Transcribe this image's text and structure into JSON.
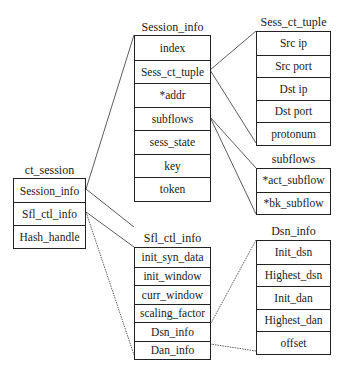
{
  "structs": {
    "ct_session": {
      "title": "ct_session",
      "fields": [
        "Session_info",
        "Sfl_ctl_info",
        "Hash_handle"
      ]
    },
    "session_info": {
      "title": "Session_info",
      "fields": [
        "index",
        "Sess_ct_tuple",
        "*addr",
        "subflows",
        "sess_state",
        "key",
        "token"
      ]
    },
    "sfl_ctl_info": {
      "title": "Sfl_ctl_info",
      "fields": [
        "init_syn_data",
        "init_window",
        "curr_window",
        "scaling_factor",
        "Dsn_info",
        "Dan_info"
      ]
    },
    "sess_ct_tuple": {
      "title": "Sess_ct_tuple",
      "fields": [
        "Src ip",
        "Src port",
        "Dst ip",
        "Dst port",
        "protonum"
      ]
    },
    "subflows": {
      "title": "subflows",
      "fields": [
        "*act_subflow",
        "*bk_subflow"
      ]
    },
    "dsn_info": {
      "title": "Dsn_info",
      "fields": [
        "Init_dsn",
        "Highest_dsn",
        "Init_dan",
        "Highest_dan",
        "offset"
      ]
    }
  },
  "links": [
    {
      "from": "ct_session.Session_info",
      "to": "Session_info",
      "style": "solid"
    },
    {
      "from": "ct_session.Sfl_ctl_info",
      "to": "Sfl_ctl_info",
      "style": "solid"
    },
    {
      "from": "Session_info.Sess_ct_tuple",
      "to": "Sess_ct_tuple",
      "style": "solid"
    },
    {
      "from": "Session_info.subflows",
      "to": "subflows",
      "style": "solid"
    },
    {
      "from": "Sfl_ctl_info.Dsn_info",
      "to": "Dsn_info",
      "style": "solid"
    },
    {
      "from": "Sfl_ctl_info.Dan_info",
      "to": "Dsn_info",
      "style": "dotted"
    }
  ]
}
